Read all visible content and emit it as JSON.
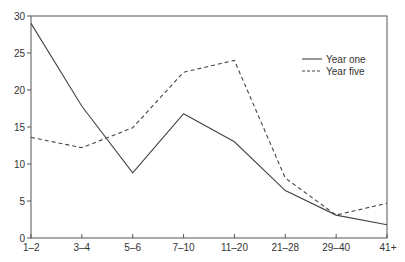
{
  "chart_data": {
    "type": "line",
    "title": "",
    "xlabel": "",
    "ylabel": "",
    "categories": [
      "1–2",
      "3–4",
      "5–6",
      "7–10",
      "11–20",
      "21–28",
      "29–40",
      "41+"
    ],
    "ylim": [
      0,
      30
    ],
    "yticks": [
      0,
      5,
      10,
      15,
      20,
      25,
      30
    ],
    "grid": false,
    "legend_position": "top-right",
    "series": [
      {
        "name": "Year one",
        "style": "solid",
        "color": "#444444",
        "values": [
          29.0,
          17.8,
          8.8,
          16.8,
          13.0,
          6.4,
          3.1,
          1.8
        ]
      },
      {
        "name": "Year five",
        "style": "dashed",
        "color": "#444444",
        "values": [
          13.6,
          12.2,
          14.9,
          22.4,
          24.0,
          8.1,
          3.1,
          4.7
        ]
      }
    ]
  }
}
